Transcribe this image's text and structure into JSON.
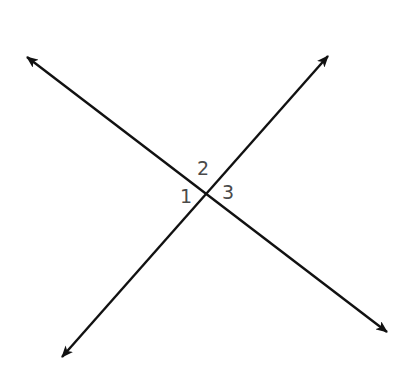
{
  "diagram": {
    "type": "intersecting-lines",
    "line_color": "#111111",
    "label_color": "#4a4a4a",
    "intersection": {
      "x": 205,
      "y": 193
    },
    "lines": [
      {
        "name": "line-nw-se",
        "start": {
          "x": 27,
          "y": 57
        },
        "end": {
          "x": 387,
          "y": 332
        },
        "arrow_start": true,
        "arrow_end": true
      },
      {
        "name": "line-sw-ne",
        "start": {
          "x": 62,
          "y": 357
        },
        "end": {
          "x": 328,
          "y": 56
        },
        "arrow_start": true,
        "arrow_end": true
      }
    ],
    "angle_labels": [
      {
        "text": "1",
        "x": 180,
        "y": 188
      },
      {
        "text": "2",
        "x": 197,
        "y": 160
      },
      {
        "text": "3",
        "x": 222,
        "y": 184
      }
    ]
  }
}
